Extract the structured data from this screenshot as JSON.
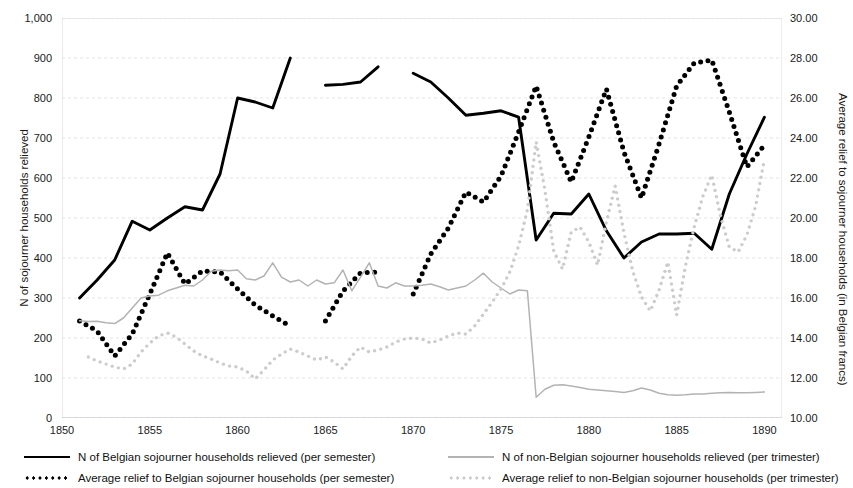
{
  "chart_data": {
    "type": "line",
    "title": "",
    "xlabel": "",
    "ylabel": "N of sojourner households relieved",
    "y2label": "Average relief to sojourner households (in Belgian francs)",
    "grid": true,
    "legend_position": "bottom",
    "xlim": [
      1850,
      1891
    ],
    "ylim": [
      0,
      1000
    ],
    "y2lim": [
      10.0,
      30.0
    ],
    "xticks": [
      "1850",
      "1855",
      "1860",
      "1865",
      "1870",
      "1875",
      "1880",
      "1885",
      "1890"
    ],
    "xtick_values": [
      1850,
      1855,
      1860,
      1865,
      1870,
      1875,
      1880,
      1885,
      1890
    ],
    "yticks_left": [
      "0",
      "100",
      "200",
      "300",
      "400",
      "500",
      "600",
      "700",
      "800",
      "900",
      "1,000"
    ],
    "ytick_values_left": [
      0,
      100,
      200,
      300,
      400,
      500,
      600,
      700,
      800,
      900,
      1000
    ],
    "yticks_right": [
      "10.00",
      "12.00",
      "14.00",
      "16.00",
      "18.00",
      "20.00",
      "22.00",
      "24.00",
      "26.00",
      "28.00",
      "30.00"
    ],
    "ytick_values_right": [
      10,
      12,
      14,
      16,
      18,
      20,
      22,
      24,
      26,
      28,
      30
    ],
    "series": [
      {
        "name": "N of Belgian sojourner households relieved (per semester)",
        "style": "solid",
        "color": "#000000",
        "axis": "left",
        "segments": [
          [
            [
              1851.0,
              300
            ],
            [
              1852.0,
              345
            ],
            [
              1853.0,
              395
            ],
            [
              1854.0,
              492
            ],
            [
              1855.0,
              470
            ],
            [
              1856.0,
              500
            ],
            [
              1857.0,
              528
            ],
            [
              1858.0,
              520
            ],
            [
              1859.0,
              610
            ],
            [
              1860.0,
              800
            ],
            [
              1861.0,
              790
            ],
            [
              1862.0,
              775
            ],
            [
              1863.0,
              900
            ]
          ],
          [
            [
              1865.0,
              832
            ],
            [
              1866.0,
              834
            ],
            [
              1867.0,
              840
            ],
            [
              1868.0,
              878
            ]
          ],
          [
            [
              1870.0,
              862
            ],
            [
              1871.0,
              840
            ],
            [
              1872.0,
              800
            ],
            [
              1873.0,
              757
            ],
            [
              1874.0,
              762
            ],
            [
              1875.0,
              768
            ],
            [
              1876.0,
              752
            ],
            [
              1877.0,
              445
            ],
            [
              1878.0,
              512
            ],
            [
              1879.0,
              510
            ],
            [
              1880.0,
              560
            ],
            [
              1881.0,
              468
            ],
            [
              1882.0,
              400
            ],
            [
              1883.0,
              440
            ],
            [
              1884.0,
              460
            ],
            [
              1885.0,
              460
            ],
            [
              1886.0,
              462
            ],
            [
              1887.0,
              422
            ],
            [
              1888.0,
              560
            ],
            [
              1889.0,
              660
            ],
            [
              1890.0,
              752
            ]
          ]
        ]
      },
      {
        "name": "Average relief to Belgian sojourner households (per semester)",
        "style": "dotted",
        "color": "#000000",
        "axis": "right",
        "segments": [
          [
            [
              1851.0,
              14.85
            ],
            [
              1852.0,
              14.35
            ],
            [
              1853.0,
              13.1
            ],
            [
              1854.0,
              14.2
            ],
            [
              1855.0,
              16.2
            ],
            [
              1856.0,
              18.25
            ],
            [
              1857.0,
              16.7
            ],
            [
              1858.0,
              17.35
            ],
            [
              1859.0,
              17.3
            ],
            [
              1860.0,
              16.45
            ],
            [
              1861.0,
              15.65
            ],
            [
              1862.0,
              15.1
            ],
            [
              1863.0,
              14.6
            ]
          ],
          [
            [
              1865.0,
              14.85
            ],
            [
              1866.0,
              16.35
            ],
            [
              1867.0,
              17.25
            ],
            [
              1868.0,
              17.3
            ]
          ],
          [
            [
              1870.0,
              16.2
            ],
            [
              1871.0,
              18.2
            ],
            [
              1872.0,
              19.5
            ],
            [
              1873.0,
              21.3
            ],
            [
              1874.0,
              20.8
            ],
            [
              1875.0,
              22.1
            ],
            [
              1876.0,
              24.3
            ],
            [
              1877.0,
              26.6
            ],
            [
              1878.0,
              23.8
            ],
            [
              1879.0,
              21.8
            ],
            [
              1880.0,
              24.05
            ],
            [
              1881.0,
              26.45
            ],
            [
              1882.0,
              23.3
            ],
            [
              1883.0,
              21.0
            ],
            [
              1884.0,
              23.7
            ],
            [
              1885.0,
              26.6
            ],
            [
              1886.0,
              27.75
            ],
            [
              1887.0,
              27.9
            ],
            [
              1888.0,
              25.3
            ],
            [
              1889.0,
              22.55
            ],
            [
              1890.0,
              23.65
            ]
          ]
        ]
      },
      {
        "name": "N of non-Belgian sojourner households relieved (per trimester)",
        "style": "solid",
        "color": "#b3b3b3",
        "axis": "left",
        "segments": [
          [
            [
              1851.0,
              243
            ],
            [
              1851.5,
              241
            ],
            [
              1852.0,
              242
            ],
            [
              1852.5,
              238
            ],
            [
              1853.0,
              236
            ],
            [
              1853.5,
              250
            ],
            [
              1854.0,
              275
            ],
            [
              1854.5,
              300
            ],
            [
              1855.0,
              305
            ],
            [
              1855.5,
              307
            ],
            [
              1856.0,
              318
            ],
            [
              1856.5,
              325
            ],
            [
              1857.0,
              332
            ],
            [
              1857.5,
              330
            ],
            [
              1858.0,
              345
            ],
            [
              1858.5,
              367
            ],
            [
              1859.0,
              370
            ],
            [
              1859.5,
              368
            ],
            [
              1860.0,
              370
            ],
            [
              1860.5,
              348
            ],
            [
              1861.0,
              345
            ],
            [
              1861.5,
              355
            ],
            [
              1862.0,
              388
            ],
            [
              1862.5,
              352
            ],
            [
              1863.0,
              340
            ],
            [
              1863.5,
              345
            ],
            [
              1864.0,
              330
            ],
            [
              1864.5,
              345
            ],
            [
              1865.0,
              335
            ],
            [
              1865.5,
              338
            ],
            [
              1866.0,
              370
            ],
            [
              1866.5,
              318
            ],
            [
              1867.0,
              352
            ],
            [
              1867.5,
              388
            ],
            [
              1868.0,
              330
            ],
            [
              1868.5,
              325
            ],
            [
              1869.0,
              338
            ],
            [
              1869.5,
              330
            ],
            [
              1870.0,
              330
            ],
            [
              1870.5,
              332
            ],
            [
              1871.0,
              335
            ],
            [
              1871.5,
              328
            ],
            [
              1872.0,
              320
            ],
            [
              1872.5,
              325
            ],
            [
              1873.0,
              330
            ],
            [
              1873.5,
              345
            ],
            [
              1874.0,
              362
            ],
            [
              1874.5,
              340
            ],
            [
              1875.0,
              325
            ],
            [
              1875.5,
              310
            ],
            [
              1876.0,
              320
            ],
            [
              1876.5,
              318
            ],
            [
              1877.0,
              52
            ],
            [
              1877.5,
              72
            ],
            [
              1878.0,
              82
            ],
            [
              1878.5,
              83
            ],
            [
              1879.0,
              80
            ],
            [
              1879.5,
              76
            ],
            [
              1880.0,
              72
            ],
            [
              1880.5,
              70
            ],
            [
              1881.0,
              68
            ],
            [
              1881.5,
              66
            ],
            [
              1882.0,
              64
            ],
            [
              1882.5,
              68
            ],
            [
              1883.0,
              75
            ],
            [
              1883.5,
              70
            ],
            [
              1884.0,
              62
            ],
            [
              1884.5,
              58
            ],
            [
              1885.0,
              57
            ],
            [
              1885.5,
              58
            ],
            [
              1886.0,
              60
            ],
            [
              1886.5,
              60
            ],
            [
              1887.0,
              62
            ],
            [
              1887.5,
              63
            ],
            [
              1888.0,
              64
            ],
            [
              1888.5,
              63
            ],
            [
              1889.0,
              63
            ],
            [
              1889.5,
              64
            ],
            [
              1890.0,
              65
            ]
          ]
        ]
      },
      {
        "name": "Average relief to non-Belgian sojourner households (per trimester)",
        "style": "dotted",
        "color": "#cccccc",
        "axis": "right",
        "segments": [
          [
            [
              1851.5,
              13.05
            ],
            [
              1852.0,
              12.85
            ],
            [
              1852.5,
              12.7
            ],
            [
              1853.0,
              12.55
            ],
            [
              1853.5,
              12.45
            ],
            [
              1854.0,
              12.7
            ],
            [
              1854.5,
              13.3
            ],
            [
              1855.0,
              13.75
            ],
            [
              1855.5,
              14.1
            ],
            [
              1856.0,
              14.25
            ],
            [
              1856.5,
              14.05
            ],
            [
              1857.0,
              13.7
            ],
            [
              1857.5,
              13.35
            ],
            [
              1858.0,
              13.1
            ],
            [
              1858.5,
              12.95
            ],
            [
              1859.0,
              12.75
            ],
            [
              1859.5,
              12.6
            ],
            [
              1860.0,
              12.55
            ],
            [
              1860.5,
              12.35
            ],
            [
              1861.0,
              11.95
            ],
            [
              1861.5,
              12.4
            ],
            [
              1862.0,
              12.9
            ],
            [
              1862.5,
              13.2
            ],
            [
              1863.0,
              13.45
            ],
            [
              1863.5,
              13.3
            ],
            [
              1864.0,
              13.1
            ],
            [
              1864.5,
              12.9
            ],
            [
              1865.0,
              13.05
            ],
            [
              1865.5,
              12.8
            ],
            [
              1866.0,
              12.45
            ],
            [
              1866.5,
              13.1
            ],
            [
              1867.0,
              13.55
            ],
            [
              1867.5,
              13.3
            ],
            [
              1868.0,
              13.4
            ],
            [
              1868.5,
              13.55
            ],
            [
              1869.0,
              13.8
            ],
            [
              1869.5,
              13.95
            ],
            [
              1870.0,
              14.0
            ],
            [
              1870.5,
              13.95
            ],
            [
              1871.0,
              13.75
            ],
            [
              1871.5,
              13.9
            ],
            [
              1872.0,
              14.1
            ],
            [
              1872.5,
              14.25
            ],
            [
              1873.0,
              14.2
            ],
            [
              1873.5,
              14.6
            ],
            [
              1874.0,
              15.2
            ],
            [
              1874.5,
              15.8
            ],
            [
              1875.0,
              16.45
            ],
            [
              1875.5,
              17.3
            ],
            [
              1876.0,
              18.6
            ],
            [
              1876.5,
              20.4
            ],
            [
              1877.0,
              23.8
            ],
            [
              1877.5,
              21.4
            ],
            [
              1878.0,
              18.35
            ],
            [
              1878.5,
              17.45
            ],
            [
              1879.0,
              19.3
            ],
            [
              1879.5,
              19.55
            ],
            [
              1880.0,
              18.8
            ],
            [
              1880.5,
              17.65
            ],
            [
              1881.0,
              19.8
            ],
            [
              1881.5,
              21.6
            ],
            [
              1882.0,
              19.25
            ],
            [
              1882.5,
              17.35
            ],
            [
              1883.0,
              16.05
            ],
            [
              1883.5,
              15.35
            ],
            [
              1884.0,
              16.4
            ],
            [
              1884.5,
              17.8
            ],
            [
              1885.0,
              15.15
            ],
            [
              1885.5,
              17.6
            ],
            [
              1886.0,
              19.55
            ],
            [
              1886.5,
              21.1
            ],
            [
              1887.0,
              22.15
            ],
            [
              1887.5,
              20.1
            ],
            [
              1888.0,
              18.55
            ],
            [
              1888.5,
              18.3
            ],
            [
              1889.0,
              19.15
            ],
            [
              1889.5,
              20.6
            ],
            [
              1890.0,
              22.95
            ]
          ]
        ]
      }
    ]
  },
  "legend": {
    "left_column": [
      {
        "label": "N of Belgian sojourner households relieved (per semester)",
        "style": "solid",
        "color": "#000000"
      },
      {
        "label": "Average relief to Belgian sojourner households (per semester)",
        "style": "dotted",
        "color": "#000000"
      }
    ],
    "right_column": [
      {
        "label": "N of non-Belgian sojourner households relieved (per trimester)",
        "style": "solid",
        "color": "#b3b3b3"
      },
      {
        "label": "Average relief to non-Belgian sojourner households (per trimester)",
        "style": "dotted",
        "color": "#cccccc"
      }
    ]
  }
}
